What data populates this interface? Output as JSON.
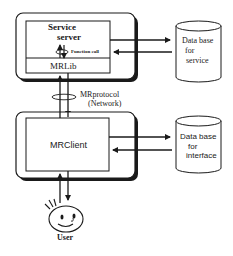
{
  "diagram": {
    "server_node": {
      "service_server_line1": "Service",
      "service_server_line2": "server",
      "function_call": "Function call",
      "library": "MRLib"
    },
    "protocol": {
      "name": "MRprotocol",
      "transport": "(Network)"
    },
    "client_node": {
      "label": "MRClient"
    },
    "db_service": {
      "line1": "Data base",
      "line2": "for",
      "line3": "service"
    },
    "db_interface": {
      "line1": "Data base",
      "line2": "for",
      "line3": "interface"
    },
    "user": {
      "label": "User"
    },
    "colors": {
      "line": "#1a1a1a",
      "background": "#ffffff"
    }
  }
}
